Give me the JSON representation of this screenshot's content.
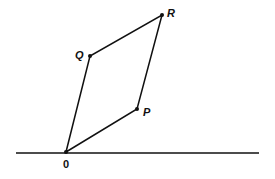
{
  "diagram": {
    "type": "parallelogram-vector-addition",
    "points": {
      "O": {
        "label": "0",
        "x": 66,
        "y": 152
      },
      "P": {
        "label": "P",
        "x": 137,
        "y": 109
      },
      "Q": {
        "label": "Q",
        "x": 90,
        "y": 56
      },
      "R": {
        "label": "R",
        "x": 162,
        "y": 15
      }
    },
    "edges": [
      [
        "O",
        "P"
      ],
      [
        "P",
        "R"
      ],
      [
        "R",
        "Q"
      ],
      [
        "Q",
        "O"
      ]
    ],
    "baseline": {
      "x1": 16,
      "x2": 259,
      "y": 153
    },
    "colors": {
      "stroke": "#111111",
      "background": "#ffffff"
    }
  }
}
